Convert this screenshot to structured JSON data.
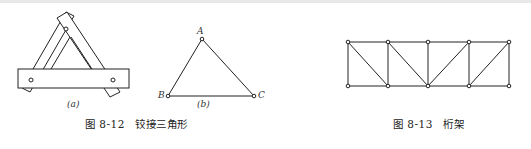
{
  "figure_12": {
    "sub_a": "(a)",
    "sub_b": "(b)",
    "nodes": {
      "A": "A",
      "B": "B",
      "C": "C"
    },
    "caption": "图 8-12　铰接三角形"
  },
  "figure_13": {
    "caption": "图 8-13　桁架"
  }
}
